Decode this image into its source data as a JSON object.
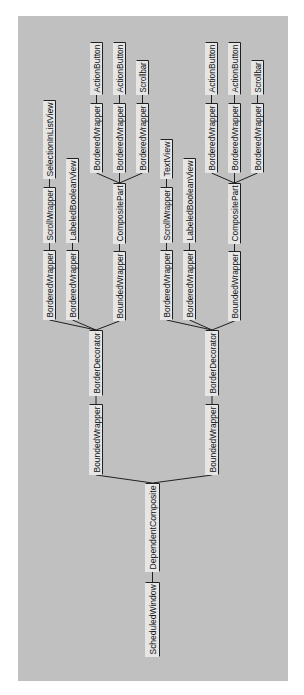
{
  "diagram": {
    "type": "tree",
    "orientation": "rotated-90-ccw",
    "colors": {
      "panel": "#c0c0c0",
      "node_fill": "#e6e6e6",
      "line": "#202020"
    },
    "nodes": [
      {
        "id": "n0",
        "label": "ScheduledWindow",
        "x": 145,
        "y": 582,
        "w": 15,
        "h": 75
      },
      {
        "id": "n1",
        "label": "DependentComposite",
        "x": 145,
        "y": 483,
        "w": 15,
        "h": 89
      },
      {
        "id": "n2",
        "label": "BoundedWrapper",
        "x": 89,
        "y": 404,
        "w": 14,
        "h": 71
      },
      {
        "id": "n3",
        "label": "BorderDecorator",
        "x": 89,
        "y": 330,
        "w": 14,
        "h": 66
      },
      {
        "id": "n4",
        "label": "BorderedWrapper",
        "x": 43,
        "y": 250,
        "w": 13,
        "h": 70
      },
      {
        "id": "n5",
        "label": "ScrollWrapper",
        "x": 43,
        "y": 187,
        "w": 13,
        "h": 56
      },
      {
        "id": "n6",
        "label": "SelectionInListView",
        "x": 43,
        "y": 100,
        "w": 13,
        "h": 79
      },
      {
        "id": "n7",
        "label": "BorderedWrapper",
        "x": 66,
        "y": 250,
        "w": 13,
        "h": 70
      },
      {
        "id": "n8",
        "label": "LabeledBooleanView",
        "x": 66,
        "y": 158,
        "w": 13,
        "h": 85
      },
      {
        "id": "n9",
        "label": "BoundedWrapper",
        "x": 113,
        "y": 251,
        "w": 13,
        "h": 70
      },
      {
        "id": "n10",
        "label": "CompositePart",
        "x": 113,
        "y": 183,
        "w": 13,
        "h": 61
      },
      {
        "id": "n11",
        "label": "BorderedWrapper",
        "x": 90,
        "y": 103,
        "w": 13,
        "h": 70
      },
      {
        "id": "n12",
        "label": "ActionButton",
        "x": 90,
        "y": 42,
        "w": 13,
        "h": 53
      },
      {
        "id": "n13",
        "label": "BorderedWrapper",
        "x": 113,
        "y": 103,
        "w": 13,
        "h": 70
      },
      {
        "id": "n14",
        "label": "ActionButton",
        "x": 113,
        "y": 42,
        "w": 13,
        "h": 53
      },
      {
        "id": "n15",
        "label": "BorderedWrapper",
        "x": 136,
        "y": 103,
        "w": 13,
        "h": 70
      },
      {
        "id": "n16",
        "label": "Scrollbar",
        "x": 136,
        "y": 60,
        "w": 13,
        "h": 35
      },
      {
        "id": "n17",
        "label": "BoundedWrapper",
        "x": 205,
        "y": 404,
        "w": 14,
        "h": 71
      },
      {
        "id": "n18",
        "label": "BorderDecorator",
        "x": 205,
        "y": 330,
        "w": 14,
        "h": 66
      },
      {
        "id": "n19",
        "label": "BorderedWrapper",
        "x": 160,
        "y": 250,
        "w": 13,
        "h": 70
      },
      {
        "id": "n20",
        "label": "ScrollWrapper",
        "x": 160,
        "y": 187,
        "w": 13,
        "h": 56
      },
      {
        "id": "n21",
        "label": "TextView",
        "x": 160,
        "y": 139,
        "w": 13,
        "h": 40
      },
      {
        "id": "n22",
        "label": "BorderedWrapper",
        "x": 183,
        "y": 250,
        "w": 13,
        "h": 70
      },
      {
        "id": "n23",
        "label": "LabeledBooleanView",
        "x": 183,
        "y": 158,
        "w": 13,
        "h": 85
      },
      {
        "id": "n24",
        "label": "BoundedWrapper",
        "x": 228,
        "y": 251,
        "w": 13,
        "h": 70
      },
      {
        "id": "n25",
        "label": "CompositePart",
        "x": 228,
        "y": 183,
        "w": 13,
        "h": 61
      },
      {
        "id": "n26",
        "label": "BorderedWrapper",
        "x": 205,
        "y": 103,
        "w": 13,
        "h": 70
      },
      {
        "id": "n27",
        "label": "ActionButton",
        "x": 205,
        "y": 42,
        "w": 13,
        "h": 53
      },
      {
        "id": "n28",
        "label": "BorderedWrapper",
        "x": 228,
        "y": 103,
        "w": 13,
        "h": 70
      },
      {
        "id": "n29",
        "label": "ActionButton",
        "x": 228,
        "y": 42,
        "w": 13,
        "h": 53
      },
      {
        "id": "n30",
        "label": "BorderedWrapper",
        "x": 251,
        "y": 103,
        "w": 13,
        "h": 70
      },
      {
        "id": "n31",
        "label": "Scrollbar",
        "x": 251,
        "y": 60,
        "w": 13,
        "h": 35
      }
    ],
    "edges": [
      [
        "n0",
        "n1"
      ],
      [
        "n1",
        "n2"
      ],
      [
        "n1",
        "n17"
      ],
      [
        "n2",
        "n3"
      ],
      [
        "n3",
        "n4"
      ],
      [
        "n3",
        "n7"
      ],
      [
        "n3",
        "n9"
      ],
      [
        "n4",
        "n5"
      ],
      [
        "n5",
        "n6"
      ],
      [
        "n7",
        "n8"
      ],
      [
        "n9",
        "n10"
      ],
      [
        "n10",
        "n11"
      ],
      [
        "n10",
        "n13"
      ],
      [
        "n10",
        "n15"
      ],
      [
        "n11",
        "n12"
      ],
      [
        "n13",
        "n14"
      ],
      [
        "n15",
        "n16"
      ],
      [
        "n17",
        "n18"
      ],
      [
        "n18",
        "n19"
      ],
      [
        "n18",
        "n22"
      ],
      [
        "n18",
        "n24"
      ],
      [
        "n19",
        "n20"
      ],
      [
        "n20",
        "n21"
      ],
      [
        "n22",
        "n23"
      ],
      [
        "n24",
        "n25"
      ],
      [
        "n25",
        "n26"
      ],
      [
        "n25",
        "n28"
      ],
      [
        "n25",
        "n30"
      ],
      [
        "n26",
        "n27"
      ],
      [
        "n28",
        "n29"
      ],
      [
        "n30",
        "n31"
      ]
    ]
  }
}
